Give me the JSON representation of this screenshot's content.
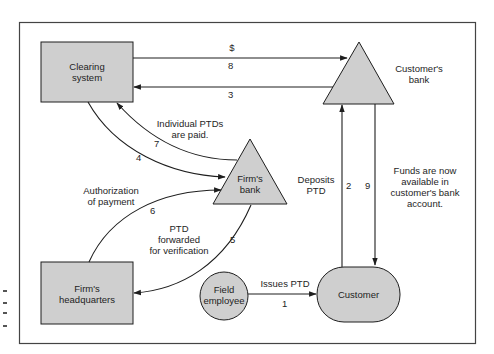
{
  "diagram": {
    "nodes": {
      "clearing_system": {
        "label": "Clearing\nsystem",
        "line1": "Clearing",
        "line2": "system",
        "shape": "rectangle"
      },
      "customers_bank": {
        "line1": "Customer's",
        "line2": "bank",
        "shape": "triangle"
      },
      "firms_bank": {
        "line1": "Firm's",
        "line2": "bank",
        "shape": "triangle"
      },
      "firms_headquarters": {
        "line1": "Firm's",
        "line2": "headquarters",
        "shape": "rectangle"
      },
      "field_employee": {
        "line1": "Field",
        "line2": "employee",
        "shape": "circle"
      },
      "customer": {
        "label": "Customer",
        "shape": "rounded-pill"
      }
    },
    "edges": [
      {
        "step": "1",
        "from": "field_employee",
        "to": "customer",
        "label": "Issues PTD"
      },
      {
        "step": "2",
        "from": "customer",
        "to": "customers_bank",
        "label_line1": "Deposits",
        "label_line2": "PTD"
      },
      {
        "step": "3",
        "from": "customers_bank",
        "to": "clearing_system",
        "label": ""
      },
      {
        "step": "4",
        "from": "clearing_system",
        "to": "firms_bank",
        "label": ""
      },
      {
        "step": "5",
        "from": "firms_bank",
        "to": "firms_headquarters",
        "label_line1": "PTD",
        "label_line2": "forwarded",
        "label_line3": "for verification"
      },
      {
        "step": "6",
        "from": "firms_headquarters",
        "to": "firms_bank",
        "label_line1": "Authorization",
        "label_line2": "of payment"
      },
      {
        "step": "7",
        "from": "firms_bank",
        "to": "clearing_system",
        "label_line1": "Individual PTDs",
        "label_line2": "are paid."
      },
      {
        "step": "8",
        "from": "clearing_system",
        "to": "customers_bank",
        "label": "$"
      },
      {
        "step": "9",
        "from": "customers_bank",
        "to": "customer",
        "label_line1": "Funds are now",
        "label_line2": "available in",
        "label_line3": "customer's bank",
        "label_line4": "account."
      }
    ],
    "colors": {
      "node_fill": "#cfcfcf",
      "stroke": "#1e1e1e",
      "background": "#ffffff"
    }
  }
}
